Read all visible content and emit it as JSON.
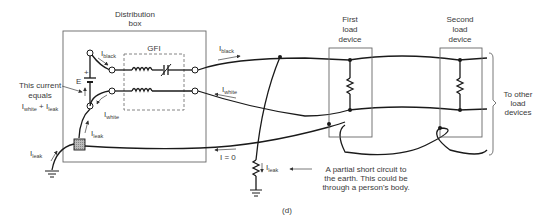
{
  "figure": {
    "caption": "(d)",
    "distribution_box": {
      "title_line1": "Distribution",
      "title_line2": "box"
    },
    "gfi_label": "GFI",
    "battery_label": "E",
    "battery_plus": "+",
    "annotation_current": {
      "line1": "This current",
      "line2": "equals",
      "line3_a": "I",
      "line3_a_sub": "white",
      "line3_plus": " + I",
      "line3_b_sub": "leak"
    },
    "currents": {
      "i_black_inner": {
        "main": "I",
        "sub": "black"
      },
      "i_white_inner": {
        "main": "I",
        "sub": "white"
      },
      "i_leak_inner": {
        "main": "I",
        "sub": "leak"
      },
      "i_leak_ground": {
        "main": "I",
        "sub": "leak"
      },
      "i_black_outer": {
        "main": "I",
        "sub": "black"
      },
      "i_white_outer": {
        "main": "I",
        "sub": "white"
      },
      "i_zero": "I = 0",
      "i_leak_short": {
        "main": "I",
        "sub": "leak"
      }
    },
    "first_load": {
      "line1": "First",
      "line2": "load",
      "line3": "device"
    },
    "second_load": {
      "line1": "Second",
      "line2": "load",
      "line3": "device"
    },
    "other_loads": {
      "line1": "To other",
      "line2": "load",
      "line3": "devices"
    },
    "short_note": {
      "line1": "A partial short circuit to",
      "line2": "the earth. This could be",
      "line3": "through a person's body."
    }
  }
}
